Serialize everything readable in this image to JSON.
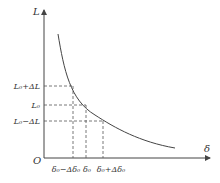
{
  "diagram": {
    "axes": {
      "y_label": "L",
      "x_label": "δ",
      "origin_label": "O"
    },
    "y_ticks": [
      {
        "id": "l0_plus",
        "label": "L₀+ΔL"
      },
      {
        "id": "l0",
        "label": "L₀"
      },
      {
        "id": "l0_minus",
        "label": "L₀−ΔL"
      }
    ],
    "x_ticks": [
      {
        "id": "d0_minus",
        "label": "δ₀−Δδ₀"
      },
      {
        "id": "d0",
        "label": "δ₀"
      },
      {
        "id": "d0_plus",
        "label": "δ₀+Δδ₀"
      }
    ],
    "curve": "decreasing hyperbola-like curve L(δ)"
  }
}
